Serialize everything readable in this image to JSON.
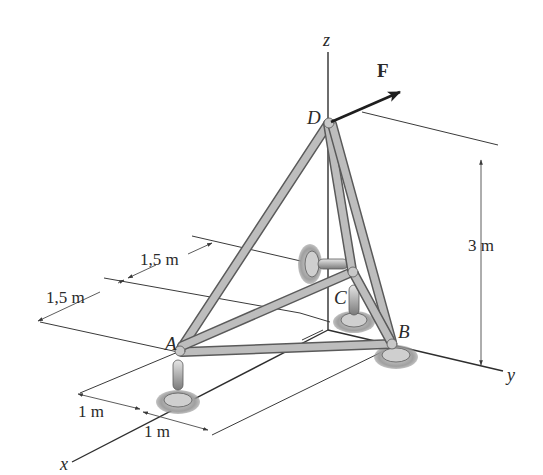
{
  "figure": {
    "type": "space truss with ball-and-socket supports",
    "axes": {
      "x": "x",
      "y": "y",
      "z": "z"
    },
    "joints": {
      "A": "A",
      "B": "B",
      "C": "C",
      "D": "D"
    },
    "load": {
      "label": "F"
    },
    "dimensions": {
      "height": "3 m",
      "y_offset_1": "1,5 m",
      "y_offset_2": "1,5 m",
      "x_offset_1": "1 m",
      "x_offset_2": "1 m"
    }
  },
  "colors": {
    "member": "#a8a8a8",
    "member_edge": "#5a5a5a",
    "support_shadow": "#9a9a9a",
    "line": "#2e2e2e",
    "force_arrow": "#1e1e1e"
  }
}
